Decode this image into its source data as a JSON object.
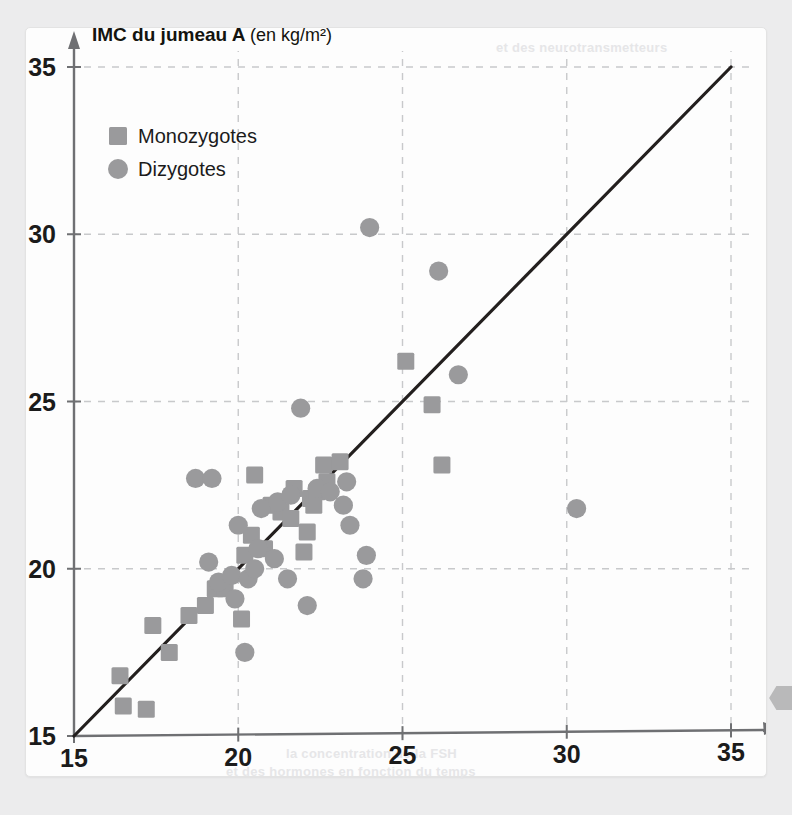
{
  "figure": {
    "background_color": "#fdfdfd",
    "page_background_color": "#ececed",
    "bleed_text_1": "et des neurotransmetteurs",
    "bleed_text_2": "la concentration de la FSH",
    "bleed_text_3": "et des hormones en fonction du temps",
    "page_tab_color": "#b9b9ba"
  },
  "chart_data": {
    "type": "scatter",
    "title": "",
    "xlabel": "IMC du jumeau B",
    "xlabel_unit": "(en kg/m²)",
    "ylabel": "IMC du jumeau A",
    "ylabel_unit": "(en kg/m²)",
    "xlim": [
      15,
      35
    ],
    "ylim": [
      15,
      35
    ],
    "xticks": [
      15,
      20,
      25,
      30,
      35
    ],
    "yticks": [
      15,
      20,
      25,
      30,
      35
    ],
    "grid": true,
    "grid_style": "dashed",
    "grid_color": "#c8c9cb",
    "marker_color": "#9a9a9c",
    "axis_color": "#6f7073",
    "identity_line": {
      "label": "y = x",
      "from": [
        15,
        15
      ],
      "to": [
        35,
        35
      ],
      "color": "#231f1e",
      "width": 3.2
    },
    "legend": {
      "position": "top-left",
      "entries": [
        {
          "name": "Monozygotes",
          "marker": "square",
          "color": "#9a9a9c"
        },
        {
          "name": "Dizygotes",
          "marker": "circle",
          "color": "#9a9a9c"
        }
      ]
    },
    "series": [
      {
        "name": "Monozygotes",
        "marker": "square",
        "color": "#9a9a9c",
        "points": [
          [
            16.4,
            16.8
          ],
          [
            16.5,
            15.9
          ],
          [
            17.2,
            15.8
          ],
          [
            17.4,
            18.3
          ],
          [
            17.9,
            17.5
          ],
          [
            18.5,
            18.6
          ],
          [
            19.0,
            18.9
          ],
          [
            19.3,
            19.4
          ],
          [
            19.6,
            19.4
          ],
          [
            20.1,
            18.5
          ],
          [
            20.2,
            20.4
          ],
          [
            20.4,
            21.0
          ],
          [
            20.5,
            22.8
          ],
          [
            20.8,
            20.6
          ],
          [
            21.0,
            21.9
          ],
          [
            21.3,
            21.7
          ],
          [
            21.6,
            21.5
          ],
          [
            21.7,
            22.4
          ],
          [
            22.0,
            20.5
          ],
          [
            22.1,
            21.1
          ],
          [
            22.2,
            22.1
          ],
          [
            22.3,
            21.9
          ],
          [
            22.4,
            22.3
          ],
          [
            22.6,
            23.1
          ],
          [
            22.7,
            22.6
          ],
          [
            23.1,
            23.2
          ],
          [
            25.1,
            26.2
          ],
          [
            25.9,
            24.9
          ],
          [
            26.2,
            23.1
          ]
        ]
      },
      {
        "name": "Dizygotes",
        "marker": "circle",
        "color": "#9a9a9c",
        "points": [
          [
            18.7,
            22.7
          ],
          [
            19.2,
            22.7
          ],
          [
            19.1,
            20.2
          ],
          [
            19.4,
            19.6
          ],
          [
            19.8,
            19.8
          ],
          [
            19.9,
            19.1
          ],
          [
            20.0,
            21.3
          ],
          [
            20.2,
            17.5
          ],
          [
            20.3,
            19.7
          ],
          [
            20.5,
            20.0
          ],
          [
            20.6,
            20.6
          ],
          [
            20.7,
            21.8
          ],
          [
            21.1,
            20.3
          ],
          [
            21.2,
            22.0
          ],
          [
            21.5,
            19.7
          ],
          [
            21.6,
            22.2
          ],
          [
            21.9,
            24.8
          ],
          [
            22.1,
            18.9
          ],
          [
            22.4,
            22.4
          ],
          [
            22.8,
            22.3
          ],
          [
            23.2,
            21.9
          ],
          [
            23.3,
            22.6
          ],
          [
            23.4,
            21.3
          ],
          [
            23.8,
            19.7
          ],
          [
            23.9,
            20.4
          ],
          [
            24.0,
            30.2
          ],
          [
            26.1,
            28.9
          ],
          [
            26.7,
            25.8
          ],
          [
            30.3,
            21.8
          ]
        ]
      }
    ]
  }
}
